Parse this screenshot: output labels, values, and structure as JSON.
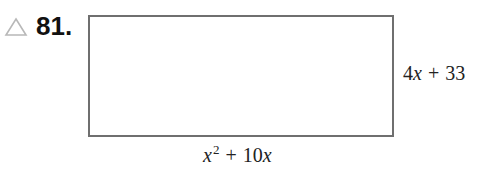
{
  "problem": {
    "marker_icon": "triangle-icon",
    "number": "81.",
    "figure": {
      "shape": "rectangle",
      "side_label": {
        "coef": "4",
        "var": "x",
        "op": "+",
        "const": "33"
      },
      "bottom_label": {
        "var1": "x",
        "exp": "2",
        "op": "+",
        "coef": "10",
        "var2": "x"
      }
    }
  }
}
